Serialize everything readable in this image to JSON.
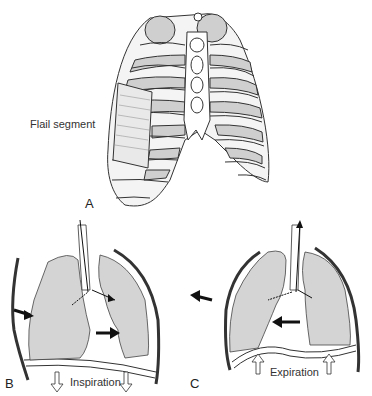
{
  "figure": {
    "panel_a": {
      "letter": "A",
      "annotation": "Flail segment"
    },
    "panel_b": {
      "letter": "B",
      "caption": "Inspiration"
    },
    "panel_c": {
      "letter": "C",
      "caption": "Expiration"
    }
  },
  "colors": {
    "lung_fill": "#d4d4d4",
    "outline": "#333333",
    "bone": "#ffffff",
    "background": "#ffffff"
  }
}
